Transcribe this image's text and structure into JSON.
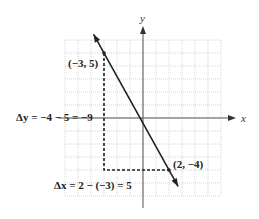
{
  "chart_data": {
    "type": "line",
    "title": "",
    "xlabel": "x",
    "ylabel": "y",
    "xlim": [
      -6,
      6
    ],
    "ylim": [
      -6,
      6
    ],
    "grid": true,
    "line": {
      "through": [
        [
          -3,
          5
        ],
        [
          2,
          -4
        ]
      ],
      "slope": -1.8
    },
    "points": [
      {
        "label": "(−3, 5)",
        "x": -3,
        "y": 5
      },
      {
        "label": "(2, −4)",
        "x": 2,
        "y": -4
      }
    ],
    "annotations": {
      "delta_y": "Δy = −4 − 5 = −9",
      "delta_x": "Δx = 2 − (−3) = 5"
    }
  },
  "colors": {
    "grid": "#b8b8b8",
    "axis": "#555555",
    "line": "#222222",
    "dashed": "#222222"
  }
}
